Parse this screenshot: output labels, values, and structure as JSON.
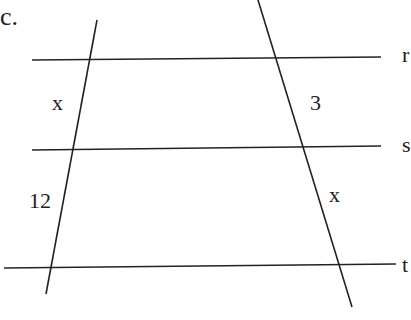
{
  "problem_label": "c.",
  "lines": {
    "parallel": [
      {
        "name": "r",
        "label": "r"
      },
      {
        "name": "s",
        "label": "s"
      },
      {
        "name": "t",
        "label": "t"
      }
    ],
    "transversals": [
      "left",
      "right"
    ]
  },
  "segments": {
    "left_upper": "x",
    "left_lower": "12",
    "right_upper": "3",
    "right_lower": "x"
  },
  "colors": {
    "stroke": "#222222",
    "background": "#ffffff"
  }
}
